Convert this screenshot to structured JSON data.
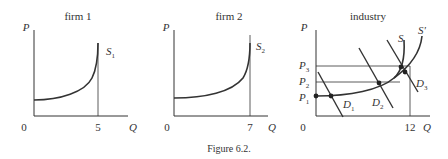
{
  "caption": "Figure 6.2.",
  "panels": [
    {
      "title": "firm 1",
      "y_label": "P",
      "x_label": "Q",
      "origin": "0",
      "capacity": "5",
      "curve_label": "S",
      "curve_sub": "1"
    },
    {
      "title": "firm 2",
      "y_label": "P",
      "x_label": "Q",
      "origin": "0",
      "capacity": "7",
      "curve_label": "S",
      "curve_sub": "2"
    },
    {
      "title": "industry",
      "y_label": "P",
      "x_label": "Q",
      "origin": "0",
      "capacity": "12",
      "supply_labels": [
        "S",
        "S'"
      ],
      "prices": [
        {
          "l": "P",
          "s": "1"
        },
        {
          "l": "P",
          "s": "2"
        },
        {
          "l": "P",
          "s": "3"
        }
      ],
      "demands": [
        {
          "l": "D",
          "s": "1"
        },
        {
          "l": "D",
          "s": "2"
        },
        {
          "l": "D",
          "s": "3"
        }
      ]
    }
  ]
}
